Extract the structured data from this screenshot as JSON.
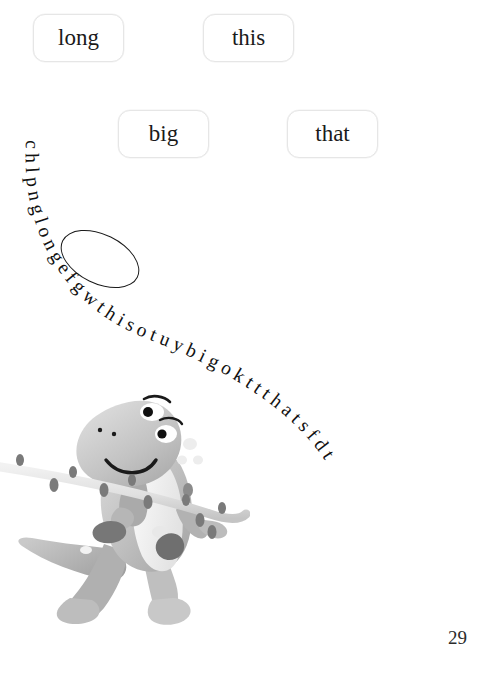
{
  "page": {
    "number": "29",
    "background_color": "#ffffff",
    "width": 487,
    "height": 677
  },
  "word_boxes": [
    {
      "label": "long",
      "selected": true
    },
    {
      "label": "this",
      "selected": false
    },
    {
      "label": "big",
      "selected": false
    },
    {
      "label": "that",
      "selected": false
    }
  ],
  "letter_path": {
    "string": "chlpnglongefgwthisotuybigokttthatsfdt",
    "letters": [
      "c",
      "h",
      "l",
      "p",
      "n",
      "g",
      "l",
      "o",
      "n",
      "g",
      "e",
      "f",
      "g",
      "w",
      "t",
      "h",
      "i",
      "s",
      "o",
      "t",
      "u",
      "y",
      "b",
      "i",
      "g",
      "o",
      "k",
      "t",
      "t",
      "t",
      "h",
      "a",
      "t",
      "s",
      "f",
      "d",
      "t"
    ],
    "hidden_words": [
      "long",
      "this",
      "big",
      "that"
    ],
    "circled_word": "long",
    "text_color": "#111111",
    "font_style": "serif"
  },
  "illustration": {
    "name": "cartoon-dinosaur-carrying-branch",
    "description": "grey cartoon tyrannosaurus walking while carrying a leafy branch over its shoulder",
    "palette": {
      "body_light": "#d9d9d9",
      "body_mid": "#b3b3b3",
      "body_dark": "#8f8f8f",
      "belly": "#f0f0f0",
      "spot_dark": "#6e6e6e",
      "outline": "#1a1a1a",
      "branch": "#e2e2e2",
      "leaf": "#7d7d7d"
    }
  },
  "styles": {
    "box_border_color": "#e6e6e6",
    "box_background": "#ffffff",
    "circle_color": "#1a1a1a"
  }
}
